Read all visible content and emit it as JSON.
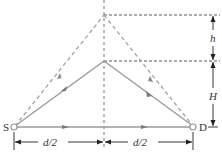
{
  "diagram": {
    "type": "ray-geometry",
    "colors": {
      "solid_path": "#9a9a9a",
      "dashed_path": "#a8a8a8",
      "guide_line": "#555555",
      "dimension": "#222222",
      "text": "#333333"
    },
    "nodes": {
      "source": {
        "label": "S"
      },
      "detector": {
        "label": "D"
      }
    },
    "dimensions": {
      "left_half": "d/2",
      "right_half": "d/2",
      "height_h": "h",
      "height_H": "H"
    }
  }
}
